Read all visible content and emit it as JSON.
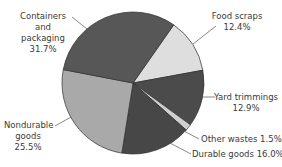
{
  "chart_data": {
    "type": "pie",
    "title": "",
    "start_angle_deg": 35,
    "direction": "clockwise",
    "slices": [
      {
        "label": "Food scraps",
        "value": 12.4,
        "display": "12.4%",
        "color": "#dedede"
      },
      {
        "label": "Yard trimmings",
        "value": 12.9,
        "display": "12.9%",
        "color": "#4b4b4b"
      },
      {
        "label": "Other wastes",
        "value": 1.5,
        "display": "1.5%",
        "color": "#cfcfcf"
      },
      {
        "label": "Durable goods",
        "value": 16.0,
        "display": "16.0%",
        "color": "#474747"
      },
      {
        "label": "Nondurable goods",
        "value": 25.5,
        "display": "25.5%",
        "color": "#a9a9a9"
      },
      {
        "label": "Containers and packaging",
        "value": 31.7,
        "display": "31.7%",
        "color": "#575757"
      }
    ]
  },
  "labels": {
    "containers_l1": "Containers and",
    "containers_l2": "packaging",
    "containers_l3": "31.7%",
    "food_l1": "Food scraps",
    "food_l2": "12.4%",
    "yard_l1": "Yard trimmings",
    "yard_l2": "12.9%",
    "other": "Other wastes 1.5%",
    "durable": "Durable goods 16.0%",
    "nondurable_l1": "Nondurable",
    "nondurable_l2": "goods",
    "nondurable_l3": "25.5%"
  }
}
